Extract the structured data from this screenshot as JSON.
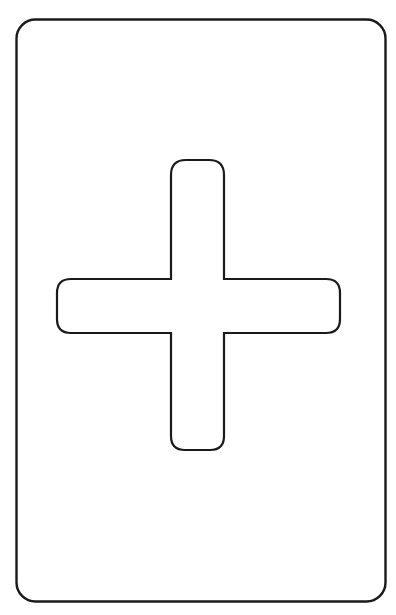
{
  "card": {
    "shape": "rounded-rectangle",
    "stroke_color": "#1a1a1a",
    "fill_color": "#ffffff"
  },
  "symbol": {
    "icon": "plus-icon",
    "stroke_color": "#1a1a1a",
    "fill_color": "#ffffff"
  }
}
